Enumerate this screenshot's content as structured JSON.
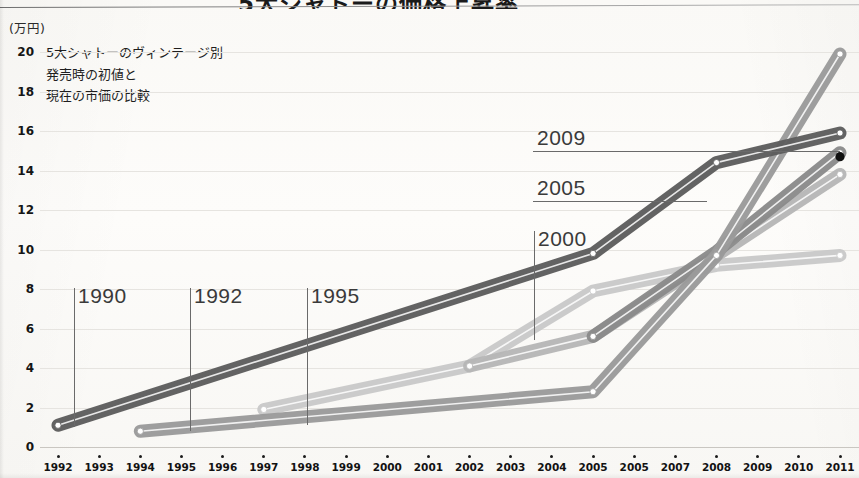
{
  "title": "5大シャトーの価格上昇率",
  "caption_lines": [
    "5大シャトーのヴィンテージ別",
    "発売時の初値と",
    "現在の市価の比較"
  ],
  "unit_label": "(万円)",
  "colors": {
    "series_1990": "#5d5d5d",
    "series_1992": "#9a9a9a",
    "series_1995": "#c9c9c9",
    "series_2000": "#b6b6b6",
    "series_2005": "#8a8a8a",
    "gridline": "#e6e4e0",
    "axis_text": "#151515",
    "annotation": "#3a3a3a",
    "end_dot": "#101010"
  },
  "annotations": [
    {
      "label": "1990",
      "leader": "vertical",
      "text_x": 78,
      "text_y": 284,
      "line_x": 74,
      "line_y1": 288,
      "line_y2": 427,
      "line_x2": 74
    },
    {
      "label": "1992",
      "leader": "vertical",
      "text_x": 194,
      "text_y": 284,
      "line_x": 190,
      "line_y1": 288,
      "line_y2": 431,
      "line_x2": 190
    },
    {
      "label": "1995",
      "leader": "vertical",
      "text_x": 311,
      "text_y": 284,
      "line_x": 307,
      "line_y1": 288,
      "line_y2": 425,
      "line_x2": 307
    },
    {
      "label": "2000",
      "leader": "vertical",
      "text_x": 538,
      "text_y": 227,
      "line_x": 534,
      "line_y1": 231,
      "line_y2": 340,
      "line_x2": 534
    },
    {
      "label": "2005",
      "leader": "horizontal",
      "text_x": 537,
      "text_y": 176,
      "line_x": 533,
      "line_y1": 201,
      "line_y2": 201,
      "line_x2": 707
    },
    {
      "label": "2009",
      "leader": "horizontal",
      "text_x": 537,
      "text_y": 126,
      "line_x": 533,
      "line_y1": 151,
      "line_y2": 151,
      "line_x2": 840
    }
  ],
  "chart_data": {
    "type": "line",
    "title": "5大シャトーの価格上昇率",
    "subtitle": "5大シャトーのヴィンテージ別 発売時の初値と 現在の市価の比較",
    "xlabel": "",
    "ylabel": "万円",
    "ylim": [
      0,
      20
    ],
    "ytick_step": 2,
    "yticks": [
      0,
      2,
      4,
      6,
      8,
      10,
      12,
      14,
      16,
      18,
      20
    ],
    "grid": true,
    "legend": "inline-annotations",
    "x_tick_labels": [
      "1992",
      "1993",
      "1994",
      "1995",
      "1996",
      "1997",
      "1998",
      "1999",
      "2000",
      "2001",
      "2002",
      "2003",
      "2004",
      "2005",
      "2005",
      "2007",
      "2008",
      "2009",
      "2010",
      "2011"
    ],
    "x_tick_values": [
      1992,
      1993,
      1994,
      1995,
      1996,
      1997,
      1998,
      1999,
      2000,
      2001,
      2002,
      2003,
      2004,
      2005,
      2006,
      2007,
      2008,
      2009,
      2010,
      2011
    ],
    "series": [
      {
        "name": "1990",
        "color": "#5d5d5d",
        "x": [
          1992,
          2005,
          2008,
          2011
        ],
        "values": [
          1.1,
          9.8,
          14.4,
          15.9
        ]
      },
      {
        "name": "1992",
        "color": "#9a9a9a",
        "x": [
          1994,
          2005,
          2008,
          2011
        ],
        "values": [
          0.8,
          2.8,
          9.7,
          19.9
        ]
      },
      {
        "name": "1995",
        "color": "#c9c9c9",
        "x": [
          1997,
          2002,
          2005,
          2008,
          2011
        ],
        "values": [
          1.9,
          4.1,
          7.9,
          9.2,
          9.7
        ]
      },
      {
        "name": "2000",
        "color": "#b6b6b6",
        "x": [
          2002,
          2005,
          2008,
          2011
        ],
        "values": [
          4.1,
          5.6,
          9.7,
          13.8
        ]
      },
      {
        "name": "2005",
        "color": "#8a8a8a",
        "x": [
          2005,
          2008,
          2011
        ],
        "values": [
          5.6,
          9.9,
          14.9
        ]
      }
    ],
    "end_marker": {
      "label": "2009",
      "x": 2011,
      "y": 14.7,
      "color": "#101010"
    }
  }
}
